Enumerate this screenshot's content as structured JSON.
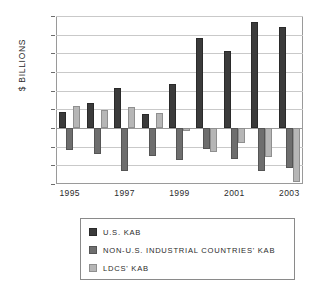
{
  "chart_data": {
    "type": "bar",
    "title": "",
    "subtitle": "",
    "xlabel": "",
    "ylabel": "$ BILLIONS",
    "ylim": [
      -300,
      600
    ],
    "ytick_step": 100,
    "yticks": [
      600,
      500,
      400,
      300,
      200,
      100,
      0,
      -100,
      -200,
      -300
    ],
    "ytick_labels": [
      "600",
      "500",
      "400",
      "300",
      "200",
      "100",
      "0",
      "-100",
      "-200",
      "-300"
    ],
    "grid": true,
    "grid_axis": "y",
    "legend_position": "bottom",
    "categories": [
      1995,
      1996,
      1997,
      1998,
      1999,
      2000,
      2001,
      2002,
      2003
    ],
    "xtick_labels": [
      "1995",
      "1997",
      "1999",
      "2001",
      "2003"
    ],
    "xticks_shown": [
      1995,
      1997,
      1999,
      2001,
      2003
    ],
    "series": [
      {
        "name": "U.S. KAB",
        "color": "#3b3b3b",
        "values": [
          85,
          135,
          215,
          75,
          235,
          480,
          410,
          570,
          540
        ]
      },
      {
        "name": "NON-U.S. INDUSTRIAL COUNTRIES' KAB",
        "color": "#6e6e6e",
        "values": [
          -120,
          -140,
          -230,
          -152,
          -170,
          -110,
          -165,
          -230,
          -212
        ]
      },
      {
        "name": "LDCS' KAB",
        "color": "#b6b6b6",
        "values": [
          120,
          98,
          110,
          82,
          -18,
          -128,
          -78,
          -158,
          -290
        ]
      }
    ]
  },
  "legend": {
    "items": [
      {
        "label": "U.S. KAB"
      },
      {
        "label": "NON-U.S. INDUSTRIAL COUNTRIES' KAB"
      },
      {
        "label": "LDCS' KAB"
      }
    ]
  }
}
